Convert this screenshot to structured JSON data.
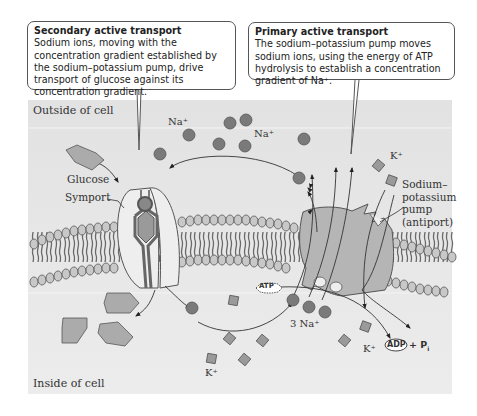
{
  "callouts": {
    "secondary": {
      "title": "Secondary active transport",
      "body": "Sodium ions, moving with the concentration gradient established by the sodium–potassium pump, drive transport of glucose against its concentration gradient."
    },
    "primary": {
      "title": "Primary active transport",
      "body": "The sodium–potassium pump moves sodium ions, using the energy of ATP hydrolysis to establish a concentration gradient of Na⁺."
    }
  },
  "regions": {
    "outside": "Outside of cell",
    "inside": "Inside of cell"
  },
  "labels": {
    "na_outside_1": "Na⁺",
    "na_outside_2": "Na⁺",
    "k_outside": "K⁺",
    "glucose": "Glucose",
    "symport": "Symport",
    "pump_line1": "Sodium–",
    "pump_line2": "potassium",
    "pump_line3": "pump",
    "pump_line4": "(antiport)",
    "atp": "ATP",
    "three_na": "3 Na⁺",
    "k_inside_1": "K⁺",
    "k_inside_2": "K⁺",
    "adp": "ADP",
    "plus_pi": "+ P",
    "pi_subscript": "i"
  },
  "colors": {
    "background": "#e6e6e6",
    "ion": "#7a7a7a",
    "protein": "#b5b5b5",
    "symport_body": "#eeeeee",
    "lipid_head": "#c8c8c8",
    "outline": "#444444"
  }
}
